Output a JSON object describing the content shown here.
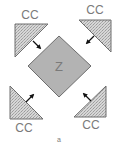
{
  "figure": {
    "center_label": "Z",
    "corner_labels": [
      "CC",
      "CC",
      "CC",
      "CC"
    ],
    "caption": "a"
  },
  "colors": {
    "diamond_fill": "#b3b3b3",
    "diamond_stroke": "#6e6e6e",
    "triangle_fill": "#d4d4d4",
    "triangle_stroke": "#6e6e6e",
    "arrow": "#111111",
    "text": "#7a7a7a"
  }
}
